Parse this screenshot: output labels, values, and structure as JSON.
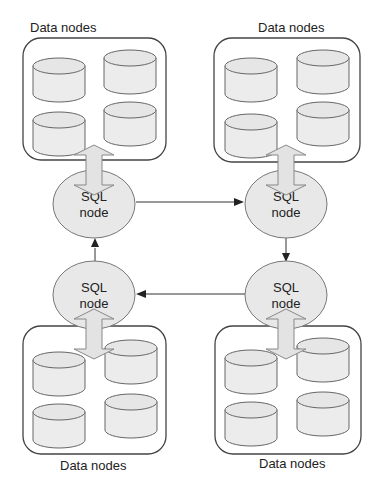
{
  "diagram": {
    "title": "",
    "clusters": [
      {
        "id": "top-left",
        "label": "Data nodes",
        "label_position": "above",
        "sql_label_line1": "SQL",
        "sql_label_line2": "node",
        "data_node_count": 4
      },
      {
        "id": "top-right",
        "label": "Data nodes",
        "label_position": "above",
        "sql_label_line1": "SQL",
        "sql_label_line2": "node",
        "data_node_count": 4
      },
      {
        "id": "bottom-left",
        "label": "Data nodes",
        "label_position": "below",
        "sql_label_line1": "SQL",
        "sql_label_line2": "node",
        "data_node_count": 4
      },
      {
        "id": "bottom-right",
        "label": "Data nodes",
        "label_position": "below",
        "sql_label_line1": "SQL",
        "sql_label_line2": "node",
        "data_node_count": 4
      }
    ],
    "edges": [
      {
        "from": "top-left SQL node",
        "to": "top-right SQL node"
      },
      {
        "from": "top-right SQL node",
        "to": "bottom-right SQL node"
      },
      {
        "from": "bottom-right SQL node",
        "to": "bottom-left SQL node"
      },
      {
        "from": "bottom-left SQL node",
        "to": "top-left SQL node"
      }
    ],
    "bidirectional_links": [
      {
        "between": [
          "top-left SQL node",
          "top-left Data nodes"
        ]
      },
      {
        "between": [
          "top-right SQL node",
          "top-right Data nodes"
        ]
      },
      {
        "between": [
          "bottom-left SQL node",
          "bottom-left Data nodes"
        ]
      },
      {
        "between": [
          "bottom-right SQL node",
          "bottom-right Data nodes"
        ]
      }
    ]
  }
}
